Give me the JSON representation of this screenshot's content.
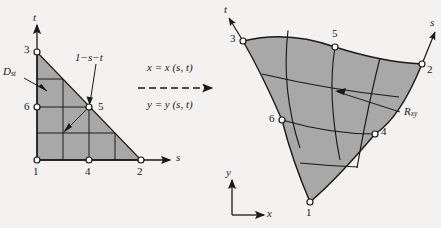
{
  "figure": {
    "background_color": "#f3f2f0",
    "fill_color": "#a8a8a8",
    "line_color": "#1a1a1a"
  },
  "left_panel": {
    "name": "parametric-st-domain",
    "domain_label": {
      "base": "D",
      "sub": "st"
    },
    "axis_s": "s",
    "axis_t": "t",
    "corner_annotation": "1−s−t",
    "nodes": [
      {
        "id": "1",
        "label": "1",
        "x": 37,
        "y": 160
      },
      {
        "id": "2",
        "label": "2",
        "x": 141,
        "y": 160
      },
      {
        "id": "3",
        "label": "3",
        "x": 37,
        "y": 52
      },
      {
        "id": "4",
        "label": "4",
        "x": 89,
        "y": 160
      },
      {
        "id": "5",
        "label": "5",
        "x": 89,
        "y": 107
      },
      {
        "id": "6",
        "label": "6",
        "x": 37,
        "y": 107
      }
    ],
    "node_label_positions": [
      {
        "label": "1",
        "x": 33,
        "y": 168
      },
      {
        "label": "2",
        "x": 137,
        "y": 168
      },
      {
        "label": "3",
        "x": 24,
        "y": 45
      },
      {
        "label": "4",
        "x": 85,
        "y": 168
      },
      {
        "label": "5",
        "x": 97,
        "y": 101
      },
      {
        "label": "6",
        "x": 24,
        "y": 101
      }
    ]
  },
  "middle": {
    "name": "mapping-equations",
    "equation_x": "x = x (s, t)",
    "equation_y": "y = y (s, t)",
    "arrow_style": "dashed-right-arrow"
  },
  "right_panel": {
    "name": "physical-xy-region",
    "region_label": {
      "base": "R",
      "sub": "xy"
    },
    "axis_s": "s",
    "axis_t": "t",
    "axis_x": "x",
    "axis_y": "y",
    "nodes": [
      {
        "id": "1",
        "label": "1",
        "x": 310,
        "y": 202
      },
      {
        "id": "2",
        "label": "2",
        "x": 422,
        "y": 64
      },
      {
        "id": "3",
        "label": "3",
        "x": 243,
        "y": 41
      },
      {
        "id": "4",
        "label": "4",
        "x": 375,
        "y": 134
      },
      {
        "id": "5",
        "label": "5",
        "x": 335,
        "y": 47
      },
      {
        "id": "6",
        "label": "6",
        "x": 282,
        "y": 120
      }
    ],
    "node_label_positions": [
      {
        "label": "1",
        "x": 307,
        "y": 211
      },
      {
        "label": "2",
        "x": 427,
        "y": 66
      },
      {
        "label": "3",
        "x": 231,
        "y": 34
      },
      {
        "label": "4",
        "x": 381,
        "y": 128
      },
      {
        "label": "5",
        "x": 332,
        "y": 31
      },
      {
        "label": "6",
        "x": 270,
        "y": 113
      }
    ]
  }
}
